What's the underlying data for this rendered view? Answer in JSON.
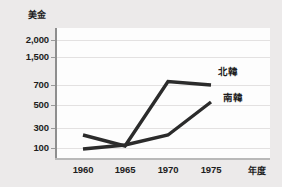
{
  "chart_data": {
    "type": "line",
    "title": "",
    "subtitle": "",
    "xlabel": "年度",
    "ylabel": "美金",
    "x": [
      "1960",
      "1965",
      "1970",
      "1975"
    ],
    "categories": [
      "1960",
      "1965",
      "1970",
      "1975"
    ],
    "ytick_labels": [
      "2,000",
      "1,500",
      "700",
      "500",
      "300",
      "100"
    ],
    "ytick_values": [
      2000,
      1500,
      700,
      500,
      300,
      100
    ],
    "yscale": "nonlinear",
    "ylim": [
      100,
      2000
    ],
    "grid": true,
    "legend_position": "right-inline",
    "series": [
      {
        "name": "北韓",
        "values": [
          230,
          120,
          800,
          700
        ],
        "color": "#2b2b2b"
      },
      {
        "name": "南韓",
        "values": [
          90,
          130,
          230,
          530
        ],
        "color": "#2b2b2b"
      }
    ],
    "annotations": [
      {
        "text": "北韓",
        "near": "1975"
      },
      {
        "text": "南韓",
        "near": "1975"
      }
    ]
  },
  "axis": {
    "y_title": "美金",
    "x_title": "年度",
    "y_ticks": [
      {
        "label": "2,000",
        "y": 40
      },
      {
        "label": "1,500",
        "y": 57
      },
      {
        "label": "700",
        "y": 85
      },
      {
        "label": "500",
        "y": 105
      },
      {
        "label": "300",
        "y": 128
      },
      {
        "label": "100",
        "y": 148
      }
    ],
    "x_ticks": [
      {
        "label": "1960",
        "x": 83
      },
      {
        "label": "1965",
        "x": 125
      },
      {
        "label": "1970",
        "x": 168
      },
      {
        "label": "1975",
        "x": 211
      }
    ]
  },
  "legend": {
    "north": "北韓",
    "south": "南韓"
  },
  "colors": {
    "background": "#eceaea",
    "panel": "#fdfdfd",
    "line": "#2b2b2b",
    "grid": "#e3e1e1",
    "axis": "#8e8e8e",
    "text": "#1d1d1d"
  },
  "paths": {
    "north_korea": "M 83,133 L 125,145 L 168,79 L 211,86",
    "south_korea": "M 83,150 L 125,143 L 168,135 L 211,103"
  }
}
